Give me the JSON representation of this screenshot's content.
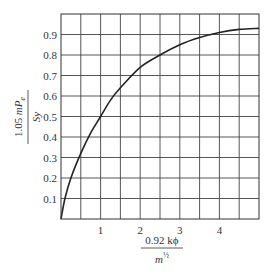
{
  "chart_data": {
    "type": "line",
    "title": "",
    "xlabel": {
      "numerator": "0.92 kϕ",
      "denominator_base": "m",
      "denominator_exp": "½"
    },
    "ylabel": {
      "numerator_prefix": "1.05 ",
      "numerator_var": "mP",
      "numerator_sub": "e",
      "denominator": "Sy"
    },
    "xlim": [
      0,
      5
    ],
    "ylim": [
      0,
      1.0
    ],
    "grid": true,
    "xticks": [
      1,
      2,
      3,
      4
    ],
    "xtick_labels": [
      "1",
      "2",
      "3",
      "4"
    ],
    "yticks": [
      0.1,
      0.2,
      0.3,
      0.4,
      0.5,
      0.6,
      0.7,
      0.8,
      0.9
    ],
    "ytick_labels": [
      "0.1",
      "0.2",
      "0.3",
      "0.4",
      "0.5",
      "0.6",
      "0.7",
      "0.8",
      "0.9"
    ],
    "grid_x_step": 0.5,
    "grid_y_step": 0.1,
    "series": [
      {
        "name": "curve",
        "color": "#222222",
        "x": [
          0,
          0.1,
          0.25,
          0.5,
          0.75,
          1.0,
          1.25,
          1.5,
          2.0,
          2.5,
          3.0,
          3.5,
          4.0,
          4.5,
          5.0
        ],
        "y": [
          0,
          0.1,
          0.2,
          0.32,
          0.42,
          0.5,
          0.58,
          0.64,
          0.74,
          0.8,
          0.85,
          0.885,
          0.91,
          0.925,
          0.93
        ]
      }
    ]
  }
}
